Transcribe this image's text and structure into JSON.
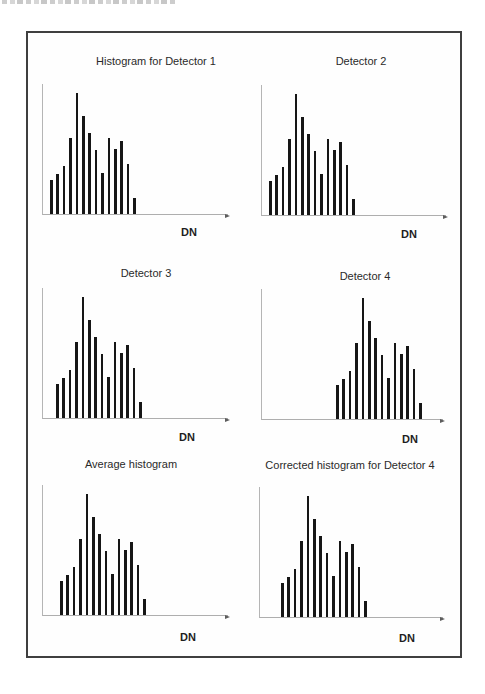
{
  "colors": {
    "bars": "#161616",
    "axes": "#b2b2b2",
    "frame": "#3f3f3f",
    "background": "#ffffff"
  },
  "chart_data": [
    {
      "panel": 1,
      "type": "bar",
      "title": "Histogram for Detector 1",
      "xlabel": "DN",
      "ylabel": "",
      "axis_ticks": "none",
      "x_axis_arrow": true,
      "bar_count": 14,
      "relative_heights": [
        0.28,
        0.33,
        0.4,
        0.63,
        1.0,
        0.81,
        0.67,
        0.53,
        0.34,
        0.63,
        0.54,
        0.6,
        0.41,
        0.13
      ],
      "first_bar_offset_px": 7
    },
    {
      "panel": 2,
      "type": "bar",
      "title": "Detector 2",
      "xlabel": "DN",
      "ylabel": "",
      "axis_ticks": "none",
      "x_axis_arrow": true,
      "bar_count": 14,
      "relative_heights": [
        0.28,
        0.33,
        0.4,
        0.63,
        1.0,
        0.81,
        0.67,
        0.53,
        0.34,
        0.63,
        0.54,
        0.6,
        0.41,
        0.13
      ],
      "first_bar_offset_px": 7
    },
    {
      "panel": 3,
      "type": "bar",
      "title": "Detector 3",
      "xlabel": "DN",
      "ylabel": "",
      "axis_ticks": "none",
      "x_axis_arrow": true,
      "bar_count": 14,
      "relative_heights": [
        0.28,
        0.33,
        0.4,
        0.63,
        1.0,
        0.81,
        0.67,
        0.53,
        0.34,
        0.63,
        0.54,
        0.6,
        0.41,
        0.13
      ],
      "first_bar_offset_px": 13
    },
    {
      "panel": 4,
      "type": "bar",
      "title": "Detector 4",
      "xlabel": "DN",
      "ylabel": "",
      "axis_ticks": "none",
      "x_axis_arrow": true,
      "bar_count": 14,
      "relative_heights": [
        0.28,
        0.33,
        0.4,
        0.63,
        1.0,
        0.81,
        0.67,
        0.53,
        0.34,
        0.63,
        0.54,
        0.6,
        0.41,
        0.13
      ],
      "first_bar_offset_px": 74
    },
    {
      "panel": 5,
      "type": "bar",
      "title": "Average histogram",
      "xlabel": "DN",
      "ylabel": "",
      "axis_ticks": "none",
      "x_axis_arrow": true,
      "bar_count": 14,
      "relative_heights": [
        0.28,
        0.33,
        0.4,
        0.63,
        1.0,
        0.81,
        0.67,
        0.53,
        0.34,
        0.63,
        0.54,
        0.6,
        0.41,
        0.13
      ],
      "first_bar_offset_px": 17
    },
    {
      "panel": 6,
      "type": "bar",
      "title": "Corrected histogram for Detector 4",
      "xlabel": "DN",
      "ylabel": "",
      "axis_ticks": "none",
      "x_axis_arrow": true,
      "bar_count": 14,
      "relative_heights": [
        0.28,
        0.33,
        0.4,
        0.63,
        1.0,
        0.81,
        0.67,
        0.53,
        0.34,
        0.63,
        0.54,
        0.6,
        0.41,
        0.13
      ],
      "first_bar_offset_px": 21
    }
  ]
}
